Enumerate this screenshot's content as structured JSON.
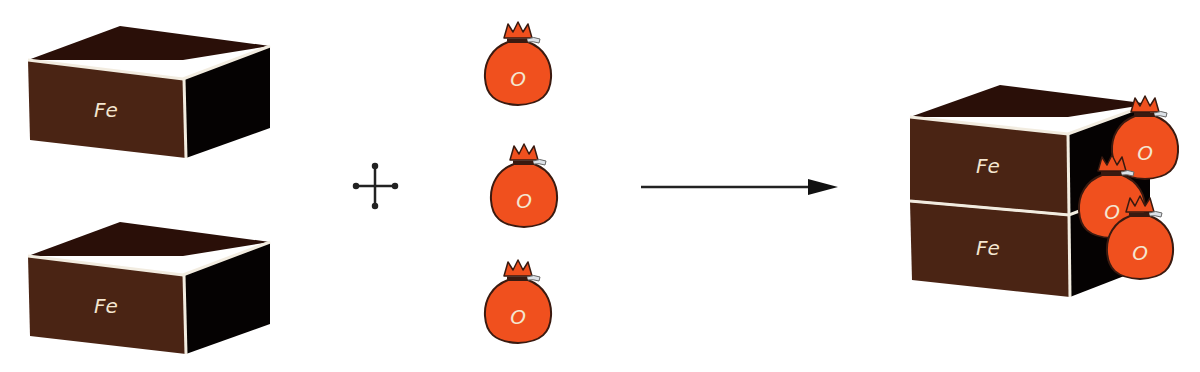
{
  "diagram": {
    "type": "chemical-reaction-illustration",
    "colors": {
      "block_front": "#4a2414",
      "block_top": "#2a0f08",
      "block_side": "#050202",
      "edge": "#f2ece0",
      "bag_fill": "#f0501e",
      "bag_outline": "#3a1a10",
      "label_text": "#f4e6d0",
      "operator": "#222222"
    },
    "reactants": {
      "iron_blocks": [
        {
          "label": "Fe"
        },
        {
          "label": "Fe"
        }
      ],
      "operator": "+",
      "oxygen_bags": [
        {
          "label": "O"
        },
        {
          "label": "O"
        },
        {
          "label": "O"
        }
      ]
    },
    "arrow": {
      "direction": "right"
    },
    "product": {
      "iron_blocks": [
        {
          "label": "Fe"
        },
        {
          "label": "Fe"
        }
      ],
      "oxygen_bags": [
        {
          "label": "O"
        },
        {
          "label": "O"
        },
        {
          "label": "O"
        }
      ]
    }
  }
}
